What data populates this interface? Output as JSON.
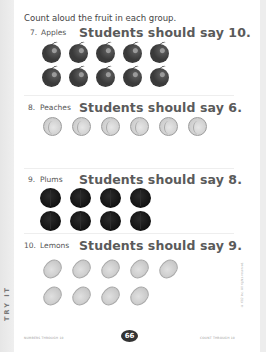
{
  "instruction": "Count aloud the fruit in each group.",
  "questions": [
    {
      "number": "7.",
      "fruit": "Apples",
      "answer": "Students should say 10.",
      "count": 10,
      "shape": "apple",
      "columns": 5
    },
    {
      "number": "8.",
      "fruit": "Peaches",
      "answer": "Students should say 6.",
      "count": 6,
      "shape": "peach",
      "columns": 6
    },
    {
      "number": "9.",
      "fruit": "Plums",
      "answer": "Students should say 8.",
      "count": 8,
      "shape": "plum",
      "columns": 4
    },
    {
      "number": "10.",
      "fruit": "Lemons",
      "answer": "Students should say 9.",
      "count": 9,
      "shape": "lemon",
      "columns": 5
    }
  ],
  "side_tab": "TRY IT",
  "footer": {
    "left": "NUMBERS THROUGH 10",
    "page_number": "66",
    "right": "COUNT THROUGH 10"
  },
  "copyright": "© K12 Inc. All rights reserved."
}
